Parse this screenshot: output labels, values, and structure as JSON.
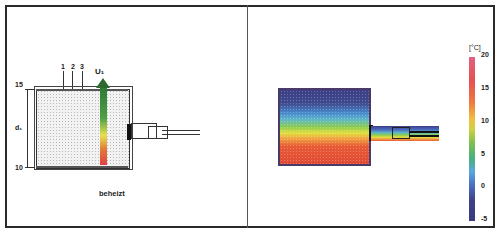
{
  "left_panel": {
    "layer_labels": [
      "1",
      "2",
      "3"
    ],
    "flow_label": "U₁",
    "top_mark": "15",
    "bottom_mark": "10",
    "thickness_label": "d₁",
    "caption": "beheizt"
  },
  "right_panel": {
    "colorbar": {
      "unit": "[°C]",
      "ticks": [
        "20",
        "15",
        "10",
        "5",
        "0",
        "-5"
      ],
      "min": -5,
      "max": 20
    }
  },
  "colors": {
    "cold": "#3d3f86",
    "warm": "#e85a35",
    "mid": "#8ccc50",
    "frame": "#2a2a2a"
  }
}
